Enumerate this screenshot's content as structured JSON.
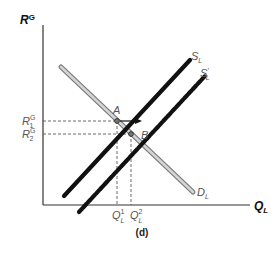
{
  "diagram": {
    "panel_label": "(d)",
    "y_axis": {
      "label": "R",
      "sup": "G"
    },
    "x_axis": {
      "label": "Q",
      "sub": "L"
    },
    "curves": {
      "supply": {
        "label": "S",
        "sub": "L"
      },
      "supply_shifted": {
        "label": "S",
        "sub": "L",
        "prime": "′"
      },
      "demand": {
        "label": "D",
        "sub": "L"
      }
    },
    "points": {
      "a": {
        "label": "A"
      },
      "b": {
        "label": "B"
      }
    },
    "y_ticks": [
      {
        "label": "R",
        "sup": "G",
        "sub": "1"
      },
      {
        "label": "R",
        "sup": "G",
        "sub": "2"
      }
    ],
    "x_ticks": [
      {
        "label": "Q",
        "sup": "1",
        "sub": "L"
      },
      {
        "label": "Q",
        "sup": "2",
        "sub": "L"
      }
    ],
    "colors": {
      "supply": "#111111",
      "demand_fill": "#cfcfcf",
      "demand_edge": "#7a7a7a",
      "axis": "#333333",
      "guide": "#444444"
    }
  }
}
